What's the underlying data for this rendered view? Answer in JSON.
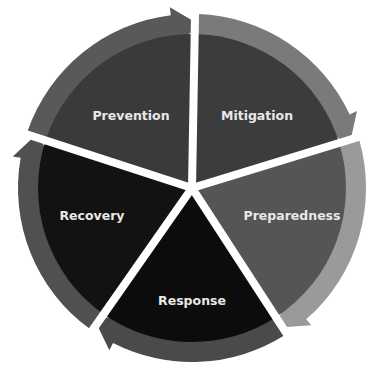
{
  "diagram": {
    "type": "cycle",
    "center": [
      192,
      188
    ],
    "outer_radius": 178,
    "inner_radius": 156,
    "segments": [
      {
        "label": "Prevention",
        "start": 198,
        "end": 271,
        "fill": "#3a3a3a",
        "arrow": "#595959",
        "label_pos": [
          131,
          116
        ]
      },
      {
        "label": "Mitigation",
        "start": 271,
        "end": 343,
        "fill": "#3c3c3c",
        "arrow": "#7a7a7a",
        "label_pos": [
          257,
          116
        ]
      },
      {
        "label": "Preparedness",
        "start": 343,
        "end": 417,
        "fill": "#555555",
        "arrow": "#9a9a9a",
        "label_pos": [
          292,
          216
        ]
      },
      {
        "label": "Response",
        "start": 57,
        "end": 125,
        "fill": "#0c0c0c",
        "arrow": "#4a4a4a",
        "label_pos": [
          192,
          301
        ]
      },
      {
        "label": "Recovery",
        "start": 125,
        "end": 198,
        "fill": "#121212",
        "arrow": "#505050",
        "label_pos": [
          92,
          216
        ]
      }
    ],
    "gap_color": "#ffffff"
  }
}
